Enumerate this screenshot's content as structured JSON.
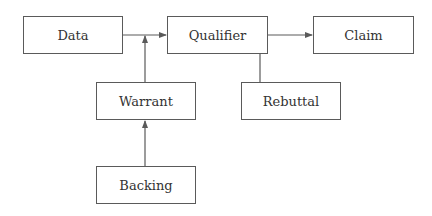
{
  "diagram": {
    "colors": {
      "stroke": "#5a5a5a",
      "text": "#333333",
      "background": "#ffffff"
    },
    "nodes": [
      {
        "id": "data",
        "label": "Data",
        "x": 23,
        "y": 16,
        "w": 100,
        "h": 38
      },
      {
        "id": "qualifier",
        "label": "Qualifier",
        "x": 167,
        "y": 16,
        "w": 101,
        "h": 38
      },
      {
        "id": "claim",
        "label": "Claim",
        "x": 313,
        "y": 16,
        "w": 101,
        "h": 38
      },
      {
        "id": "warrant",
        "label": "Warrant",
        "x": 96,
        "y": 82,
        "w": 100,
        "h": 38
      },
      {
        "id": "rebuttal",
        "label": "Rebuttal",
        "x": 241,
        "y": 82,
        "w": 100,
        "h": 38
      },
      {
        "id": "backing",
        "label": "Backing",
        "x": 96,
        "y": 166,
        "w": 100,
        "h": 38
      }
    ],
    "edges": [
      {
        "from": "data",
        "to": "qualifier",
        "arrow": true
      },
      {
        "from": "warrant",
        "to": "data-qualifier-junction",
        "arrow": true
      },
      {
        "from": "qualifier",
        "to": "claim",
        "arrow": true
      },
      {
        "from": "qualifier",
        "to": "rebuttal",
        "arrow": false
      },
      {
        "from": "backing",
        "to": "warrant",
        "arrow": true
      }
    ]
  }
}
